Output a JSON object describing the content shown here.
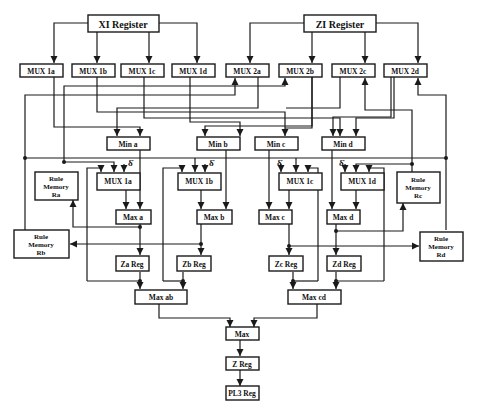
{
  "diagram": {
    "type": "block-diagram",
    "registers_top": [
      {
        "id": "xi",
        "label": "XI Register"
      },
      {
        "id": "zi",
        "label": "ZI Register"
      }
    ],
    "mux_row": [
      {
        "id": "mux1a",
        "label": "MUX 1a"
      },
      {
        "id": "mux1b",
        "label": "MUX 1b"
      },
      {
        "id": "mux1c",
        "label": "MUX 1c"
      },
      {
        "id": "mux1d",
        "label": "MUX 1d"
      },
      {
        "id": "mux2a",
        "label": "MUX 2a"
      },
      {
        "id": "mux2b",
        "label": "MUX 2b"
      },
      {
        "id": "mux2c",
        "label": "MUX 2c"
      },
      {
        "id": "mux2d",
        "label": "MUX 2d"
      }
    ],
    "min_row": [
      {
        "id": "mina",
        "label": "Min a"
      },
      {
        "id": "minb",
        "label": "Min b"
      },
      {
        "id": "minc",
        "label": "Min c"
      },
      {
        "id": "mind",
        "label": "Min d"
      }
    ],
    "lower_mux_row": [
      {
        "id": "lmux1a",
        "label": "MUX 1a"
      },
      {
        "id": "lmux1b",
        "label": "MUX 1b"
      },
      {
        "id": "lmux1c",
        "label": "MUX 1c"
      },
      {
        "id": "lmux1d",
        "label": "MUX 1d"
      }
    ],
    "delta_symbol": "δ̇",
    "max_row": [
      {
        "id": "maxa",
        "label": "Max a"
      },
      {
        "id": "maxb",
        "label": "Max  b"
      },
      {
        "id": "maxc",
        "label": "Max c"
      },
      {
        "id": "maxd",
        "label": "Max d"
      }
    ],
    "rule_memories": [
      {
        "id": "ra",
        "line1": "Rule",
        "line2": "Memory",
        "line3": "Ra"
      },
      {
        "id": "rb",
        "line1": "Rule",
        "line2": "Memory",
        "line3": "Rb"
      },
      {
        "id": "rc",
        "line1": "Rule",
        "line2": "Memory",
        "line3": "Rc"
      },
      {
        "id": "rd",
        "line1": "Rule",
        "line2": "Memory",
        "line3": "Rd"
      }
    ],
    "z_regs": [
      {
        "id": "za",
        "label": "Za Reg"
      },
      {
        "id": "zb",
        "label": "Zb Reg"
      },
      {
        "id": "zc",
        "label": "Zc Reg"
      },
      {
        "id": "zd",
        "label": "Zd Reg"
      }
    ],
    "max_pairs": [
      {
        "id": "maxab",
        "label": "Max  ab"
      },
      {
        "id": "maxcd",
        "label": "Max cd"
      }
    ],
    "final": [
      {
        "id": "max",
        "label": "Max"
      },
      {
        "id": "zreg",
        "label": "Z  Reg"
      },
      {
        "id": "pl3",
        "label": "PL3 Reg"
      }
    ]
  }
}
